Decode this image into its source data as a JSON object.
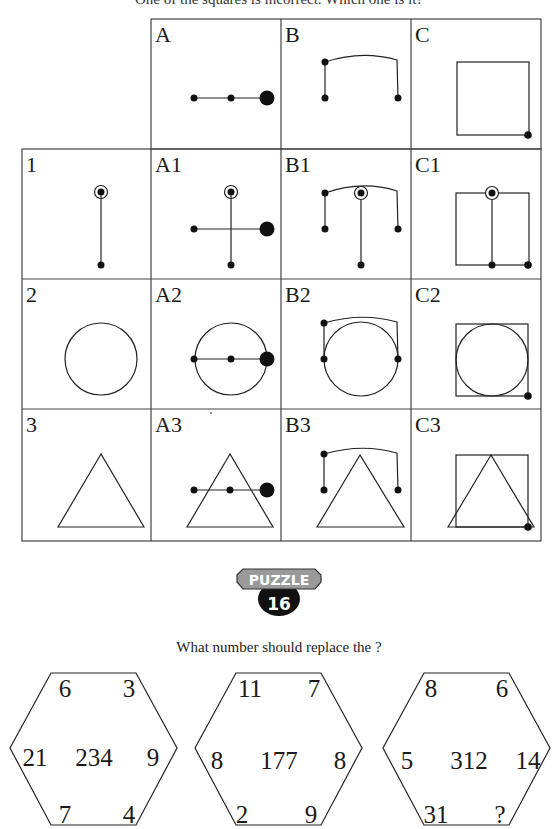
{
  "intro_text": "One of the squares is incorrect. Which one is it?",
  "grid": {
    "column_headers": [
      "A",
      "B",
      "C"
    ],
    "row_headers": [
      "1",
      "2",
      "3"
    ],
    "cells": [
      [
        "A1",
        "B1",
        "C1"
      ],
      [
        "A2",
        "B2",
        "C2"
      ],
      [
        "A3",
        "B3",
        "C3"
      ]
    ]
  },
  "badge": {
    "label": "PUZZLE",
    "number": "16"
  },
  "question": "What number should replace the ?",
  "hexagons": [
    {
      "top_left": "6",
      "top_right": "3",
      "left": "21",
      "center": "234",
      "right": "9",
      "bottom_left": "7",
      "bottom_right": "4"
    },
    {
      "top_left": "11",
      "top_right": "7",
      "left": "8",
      "center": "177",
      "right": "8",
      "bottom_left": "2",
      "bottom_right": "9"
    },
    {
      "top_left": "8",
      "top_right": "6",
      "left": "5",
      "center": "312",
      "right": "14",
      "bottom_left": "31",
      "bottom_right": "?"
    }
  ]
}
